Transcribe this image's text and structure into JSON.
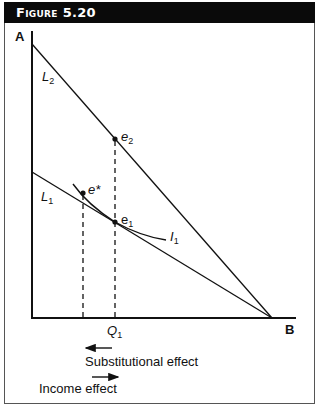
{
  "figure": {
    "title": "Figure 5.20"
  },
  "diagram": {
    "axis_labels": {
      "y_axis_top": "A",
      "x_axis_end": "B",
      "q1": "Q",
      "q1_sub": "1"
    },
    "lines": {
      "l2": {
        "label": "L",
        "sub": "2"
      },
      "l1": {
        "label": "L",
        "sub": "1"
      },
      "indifference": {
        "label": "I",
        "sub": "1"
      }
    },
    "points": {
      "e2": {
        "label": "e",
        "sub": "2"
      },
      "e1": {
        "label": "e",
        "sub": "1"
      },
      "e_star": {
        "label": "e*"
      }
    },
    "effects": {
      "substitution": {
        "label": "Substitutional effect",
        "direction": "left"
      },
      "income": {
        "label": "Income effect",
        "direction": "right"
      }
    },
    "colors": {
      "ink": "#111111",
      "header_bg": "#0a0a0a",
      "header_text": "#ffffff"
    }
  }
}
